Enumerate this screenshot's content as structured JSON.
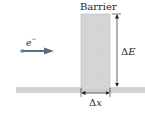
{
  "diagram": {
    "barrier_label": "Barrier",
    "particle_label": "e",
    "particle_charge": "−",
    "height_label_delta": "Δ",
    "height_label_var": "E",
    "width_label_delta": "Δ",
    "width_label_var": "x",
    "colors": {
      "barrier_fill": "#d4d4d4",
      "barrier_edge": "#b8b8b8",
      "ground": "#cfcfcf",
      "arrow_blue": "#5a6f8a",
      "dimension_line": "#222222"
    }
  }
}
